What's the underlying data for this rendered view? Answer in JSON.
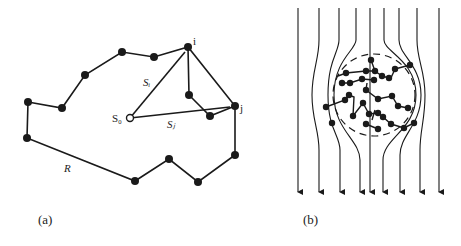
{
  "figure": {
    "panel_a": {
      "caption": "(a)",
      "labels": {
        "i": "i",
        "j": "j",
        "s0": "S₀",
        "si": "Sᵢ",
        "sj": "Sⱼ",
        "r": "R"
      },
      "description": "Closed polymer chain (polygon of beads) with starting point S0 connected to beads i and j by vectors Si and Sj; end-to-end vector R"
    },
    "panel_b": {
      "caption": "(b)",
      "description": "Flow streamlines (downward arrows) deflected around a coiled polymer chain enclosed by a dashed circle",
      "streamline_count": 9
    },
    "colors": {
      "ink": "#1a1a1a",
      "background": "#ffffff"
    }
  }
}
